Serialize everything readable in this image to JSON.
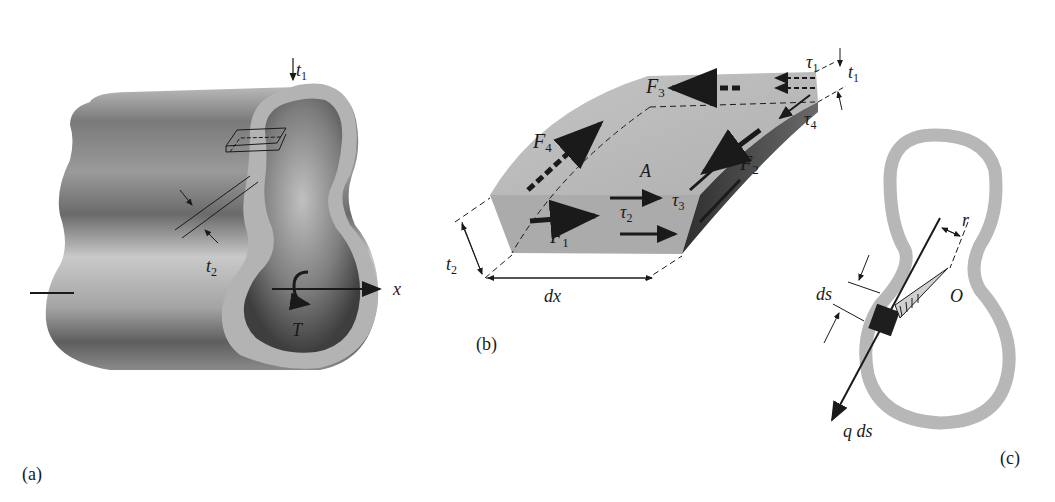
{
  "figure": {
    "panels": [
      {
        "id": "a",
        "caption": "(a)",
        "labels": {
          "t1": "t",
          "t1_sub": "1",
          "t2": "t",
          "t2_sub": "2",
          "x_axis": "x",
          "torque": "T"
        }
      },
      {
        "id": "b",
        "caption": "(b)",
        "labels": {
          "F1": "F",
          "F1_sub": "1",
          "F2": "F",
          "F2_sub": "2",
          "F3": "F",
          "F3_sub": "3",
          "F4": "F",
          "F4_sub": "4",
          "tau1": "τ",
          "tau1_sub": "1",
          "tau2": "τ",
          "tau2_sub": "2",
          "tau3": "τ",
          "tau3_sub": "3",
          "tau4": "τ",
          "tau4_sub": "4",
          "t1": "t",
          "t1_sub": "1",
          "t2": "t",
          "t2_sub": "2",
          "dx": "dx",
          "A": "A"
        }
      },
      {
        "id": "c",
        "caption": "(c)",
        "labels": {
          "ds": "ds",
          "r": "r",
          "O": "O",
          "qds": "q ds"
        }
      }
    ],
    "colors": {
      "tube_dark": "#5a5a5a",
      "tube_light": "#c8c8c8",
      "wall": "#b5b5b5",
      "ink": "#1a1a1a"
    }
  }
}
